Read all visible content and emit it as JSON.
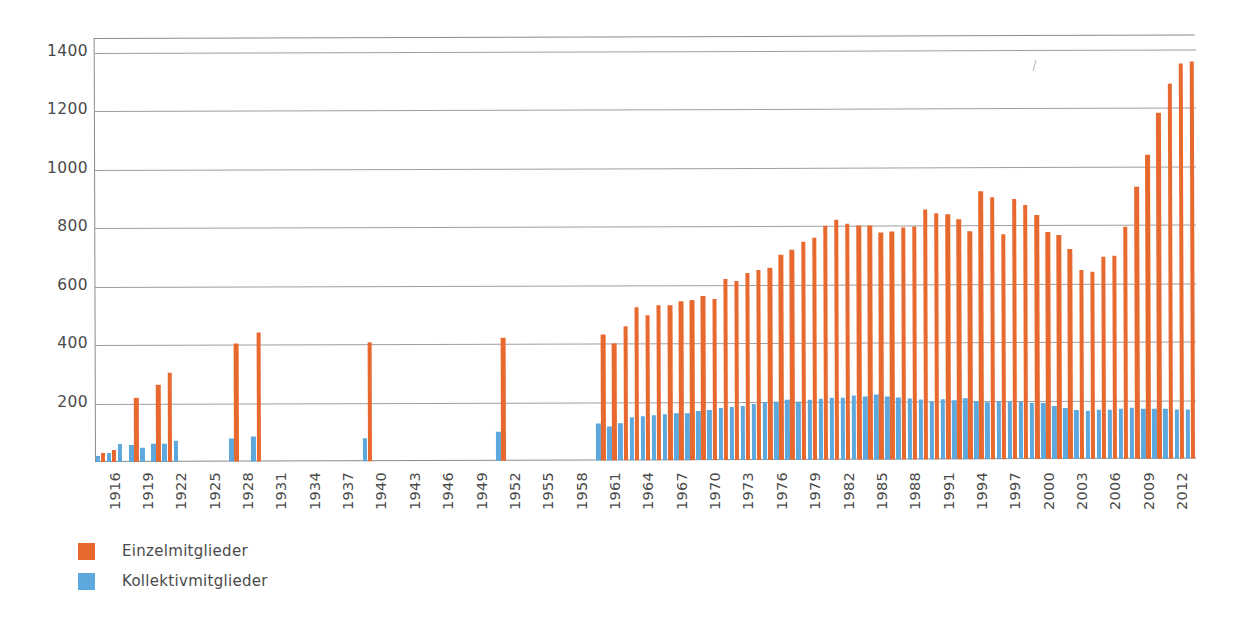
{
  "chart_data": {
    "type": "bar",
    "title": "",
    "subtitle": "",
    "xlabel": "",
    "ylabel": "",
    "ylim": [
      0,
      1450
    ],
    "yticks": [
      200,
      400,
      600,
      800,
      1000,
      1200,
      1400
    ],
    "grid": true,
    "legend_position": "bottom-left",
    "x_tick_step": 3,
    "x_tick_start": 1916,
    "x_ticks": [
      1916,
      1919,
      1922,
      1925,
      1928,
      1931,
      1934,
      1937,
      1940,
      1943,
      1946,
      1949,
      1952,
      1955,
      1958,
      1961,
      1964,
      1967,
      1970,
      1973,
      1976,
      1979,
      1982,
      1985,
      1988,
      1991,
      1994,
      1997,
      2000,
      2003,
      2006,
      2009,
      2012
    ],
    "x_range": [
      1916,
      2014
    ],
    "colors": {
      "Einzelmitglieder": "#e8692f",
      "Kollektivmitglieder": "#5da9dd"
    },
    "series": [
      {
        "name": "Einzelmitglieder",
        "color": "#e8692f",
        "values": [
          {
            "x": 1916,
            "y": 30
          },
          {
            "x": 1917,
            "y": 40
          },
          {
            "x": 1918,
            "y": 0
          },
          {
            "x": 1919,
            "y": 220
          },
          {
            "x": 1920,
            "y": 0
          },
          {
            "x": 1921,
            "y": 265
          },
          {
            "x": 1922,
            "y": 305
          },
          {
            "x": 1928,
            "y": 405
          },
          {
            "x": 1930,
            "y": 440
          },
          {
            "x": 1940,
            "y": 408
          },
          {
            "x": 1952,
            "y": 420
          },
          {
            "x": 1961,
            "y": 432
          },
          {
            "x": 1962,
            "y": 400
          },
          {
            "x": 1963,
            "y": 460
          },
          {
            "x": 1964,
            "y": 522
          },
          {
            "x": 1965,
            "y": 495
          },
          {
            "x": 1966,
            "y": 530
          },
          {
            "x": 1967,
            "y": 530
          },
          {
            "x": 1968,
            "y": 545
          },
          {
            "x": 1969,
            "y": 548
          },
          {
            "x": 1970,
            "y": 560
          },
          {
            "x": 1971,
            "y": 552
          },
          {
            "x": 1972,
            "y": 618
          },
          {
            "x": 1973,
            "y": 612
          },
          {
            "x": 1974,
            "y": 640
          },
          {
            "x": 1975,
            "y": 650
          },
          {
            "x": 1976,
            "y": 655
          },
          {
            "x": 1977,
            "y": 700
          },
          {
            "x": 1978,
            "y": 718
          },
          {
            "x": 1979,
            "y": 745
          },
          {
            "x": 1980,
            "y": 760
          },
          {
            "x": 1981,
            "y": 800
          },
          {
            "x": 1982,
            "y": 822
          },
          {
            "x": 1983,
            "y": 808
          },
          {
            "x": 1984,
            "y": 800
          },
          {
            "x": 1985,
            "y": 800
          },
          {
            "x": 1986,
            "y": 775
          },
          {
            "x": 1987,
            "y": 780
          },
          {
            "x": 1988,
            "y": 795
          },
          {
            "x": 1989,
            "y": 798
          },
          {
            "x": 1990,
            "y": 855
          },
          {
            "x": 1991,
            "y": 840
          },
          {
            "x": 1992,
            "y": 838
          },
          {
            "x": 1993,
            "y": 820
          },
          {
            "x": 1994,
            "y": 780
          },
          {
            "x": 1995,
            "y": 915
          },
          {
            "x": 1996,
            "y": 895
          },
          {
            "x": 1997,
            "y": 770
          },
          {
            "x": 1998,
            "y": 890
          },
          {
            "x": 1999,
            "y": 868
          },
          {
            "x": 2000,
            "y": 835
          },
          {
            "x": 2001,
            "y": 775
          },
          {
            "x": 2002,
            "y": 765
          },
          {
            "x": 2003,
            "y": 718
          },
          {
            "x": 2004,
            "y": 648
          },
          {
            "x": 2005,
            "y": 640
          },
          {
            "x": 2006,
            "y": 690
          },
          {
            "x": 2007,
            "y": 695
          },
          {
            "x": 2008,
            "y": 792
          },
          {
            "x": 2009,
            "y": 930
          },
          {
            "x": 2010,
            "y": 1040
          },
          {
            "x": 2011,
            "y": 1185
          },
          {
            "x": 2012,
            "y": 1282
          },
          {
            "x": 2013,
            "y": 1350
          },
          {
            "x": 2014,
            "y": 1358
          }
        ]
      },
      {
        "name": "Kollektivmitglieder",
        "color": "#5da9dd",
        "values": [
          {
            "x": 1916,
            "y": 22
          },
          {
            "x": 1917,
            "y": 30
          },
          {
            "x": 1918,
            "y": 60
          },
          {
            "x": 1919,
            "y": 58
          },
          {
            "x": 1920,
            "y": 48
          },
          {
            "x": 1921,
            "y": 62
          },
          {
            "x": 1922,
            "y": 62
          },
          {
            "x": 1923,
            "y": 72
          },
          {
            "x": 1928,
            "y": 78
          },
          {
            "x": 1930,
            "y": 85
          },
          {
            "x": 1940,
            "y": 78
          },
          {
            "x": 1952,
            "y": 100
          },
          {
            "x": 1961,
            "y": 125
          },
          {
            "x": 1962,
            "y": 118
          },
          {
            "x": 1963,
            "y": 128
          },
          {
            "x": 1964,
            "y": 148
          },
          {
            "x": 1965,
            "y": 152
          },
          {
            "x": 1966,
            "y": 155
          },
          {
            "x": 1967,
            "y": 158
          },
          {
            "x": 1968,
            "y": 160
          },
          {
            "x": 1969,
            "y": 160
          },
          {
            "x": 1970,
            "y": 168
          },
          {
            "x": 1971,
            "y": 172
          },
          {
            "x": 1972,
            "y": 178
          },
          {
            "x": 1973,
            "y": 180
          },
          {
            "x": 1974,
            "y": 185
          },
          {
            "x": 1975,
            "y": 190
          },
          {
            "x": 1976,
            "y": 198
          },
          {
            "x": 1977,
            "y": 200
          },
          {
            "x": 1978,
            "y": 205
          },
          {
            "x": 1979,
            "y": 200
          },
          {
            "x": 1980,
            "y": 205
          },
          {
            "x": 1981,
            "y": 208
          },
          {
            "x": 1982,
            "y": 212
          },
          {
            "x": 1983,
            "y": 212
          },
          {
            "x": 1984,
            "y": 218
          },
          {
            "x": 1985,
            "y": 215
          },
          {
            "x": 1986,
            "y": 222
          },
          {
            "x": 1987,
            "y": 215
          },
          {
            "x": 1988,
            "y": 212
          },
          {
            "x": 1989,
            "y": 208
          },
          {
            "x": 1990,
            "y": 205
          },
          {
            "x": 1991,
            "y": 200
          },
          {
            "x": 1992,
            "y": 205
          },
          {
            "x": 1993,
            "y": 202
          },
          {
            "x": 1994,
            "y": 208
          },
          {
            "x": 1995,
            "y": 200
          },
          {
            "x": 1996,
            "y": 195
          },
          {
            "x": 1997,
            "y": 198
          },
          {
            "x": 1998,
            "y": 198
          },
          {
            "x": 1999,
            "y": 195
          },
          {
            "x": 2000,
            "y": 192
          },
          {
            "x": 2001,
            "y": 190
          },
          {
            "x": 2002,
            "y": 182
          },
          {
            "x": 2003,
            "y": 175
          },
          {
            "x": 2004,
            "y": 168
          },
          {
            "x": 2005,
            "y": 165
          },
          {
            "x": 2006,
            "y": 168
          },
          {
            "x": 2007,
            "y": 168
          },
          {
            "x": 2008,
            "y": 172
          },
          {
            "x": 2009,
            "y": 175
          },
          {
            "x": 2010,
            "y": 172
          },
          {
            "x": 2011,
            "y": 170
          },
          {
            "x": 2012,
            "y": 170
          },
          {
            "x": 2013,
            "y": 168
          },
          {
            "x": 2014,
            "y": 168
          }
        ]
      }
    ]
  },
  "legend": {
    "items": [
      {
        "label": "Einzelmitglieder",
        "color": "#e8692f"
      },
      {
        "label": "Kollektivmitglieder",
        "color": "#5da9dd"
      }
    ]
  }
}
